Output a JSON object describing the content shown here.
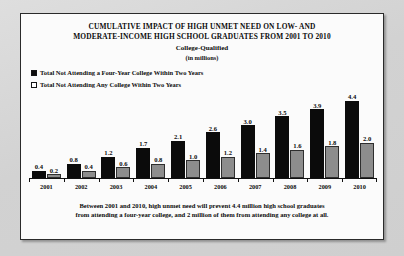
{
  "figure": {
    "title_lines": [
      "CUMULATIVE  IMPACT OF HIGH UNMET NEED ON LOW- AND",
      "MODERATE-INCOME HIGH SCHOOL GRADUATES FROM 2001 TO 2010"
    ],
    "subtitle": "College-Qualified",
    "units": "(in millions)",
    "footnote_lines": [
      "Between 2001 and 2010, high unmet need will prevent 4.4 million high school graduates",
      "from attending a four-year college, and 2 million of them from attending any college at all."
    ]
  },
  "colors": {
    "series_dark": "#0b0b0b",
    "series_light": "#8d8d8d",
    "axis": "#101010",
    "panel_background": "#fbfbfb",
    "page_background": "#d5d5d5"
  },
  "chart_data": {
    "type": "bar",
    "title": "CUMULATIVE  IMPACT OF HIGH UNMET NEED ON LOW- AND MODERATE-INCOME HIGH SCHOOL GRADUATES FROM 2001 TO 2010",
    "subtitle": "College-Qualified",
    "xlabel": "",
    "ylabel": "(in millions)",
    "ylim": [
      0,
      4.4
    ],
    "grid": false,
    "legend_position": "top-left",
    "categories": [
      "2001",
      "2002",
      "2003",
      "2004",
      "2005",
      "2006",
      "2007",
      "2008",
      "2009",
      "2010"
    ],
    "series": [
      {
        "name": "Total Not Attending a Four-Year College Within Two Years",
        "color": "#0b0b0b",
        "values": [
          0.4,
          0.8,
          1.2,
          1.7,
          2.1,
          2.6,
          3.0,
          3.5,
          3.9,
          4.4
        ],
        "labels": [
          "0.4",
          "0.8",
          "1.2",
          "1.7",
          "2.1",
          "2.6",
          "3.0",
          "3.5",
          "3.9",
          "4.4"
        ]
      },
      {
        "name": "Total Not Attending Any College Within Two Years",
        "color": "#8d8d8d",
        "values": [
          0.2,
          0.4,
          0.6,
          0.8,
          1.0,
          1.2,
          1.4,
          1.6,
          1.8,
          2.0
        ],
        "labels": [
          "0.2",
          "0.4",
          "0.6",
          "0.8",
          "1.0",
          "1.2",
          "1.4",
          "1.6",
          "1.8",
          "2.0"
        ]
      }
    ]
  }
}
